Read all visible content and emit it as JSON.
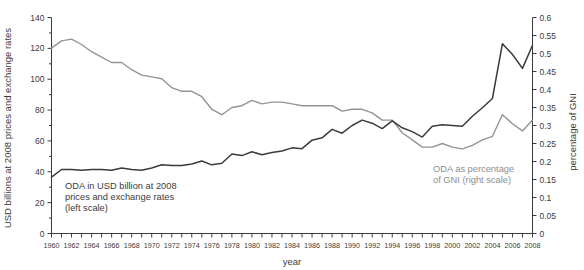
{
  "chart_data": {
    "type": "line",
    "title": "",
    "xlabel": "year",
    "ylabel": "USD billions at 2008 prices and exchange rates",
    "y2label": "percentage of GNI",
    "xlim": [
      1960,
      2008
    ],
    "ylim": [
      0,
      140
    ],
    "y2lim": [
      0,
      0.6
    ],
    "grid": false,
    "legend_position": "inline-annotations",
    "x": [
      1960,
      1961,
      1962,
      1963,
      1964,
      1965,
      1966,
      1967,
      1968,
      1969,
      1970,
      1971,
      1972,
      1973,
      1974,
      1975,
      1976,
      1977,
      1978,
      1979,
      1980,
      1981,
      1982,
      1983,
      1984,
      1985,
      1986,
      1987,
      1988,
      1989,
      1990,
      1991,
      1992,
      1993,
      1994,
      1995,
      1996,
      1997,
      1998,
      1999,
      2000,
      2001,
      2002,
      2003,
      2004,
      2005,
      2006,
      2007,
      2008
    ],
    "xtick_labels": [
      "1960",
      "1962",
      "1964",
      "1966",
      "1968",
      "1970",
      "1972",
      "1974",
      "1976",
      "1978",
      "1980",
      "1982",
      "1984",
      "1986",
      "1988",
      "1990",
      "1992",
      "1994",
      "1996",
      "1998",
      "2000",
      "2002",
      "2004",
      "2006",
      "2008"
    ],
    "ytick_labels": [
      "0",
      "20",
      "40",
      "60",
      "80",
      "100",
      "120",
      "140"
    ],
    "ytick_values": [
      0,
      20,
      40,
      60,
      80,
      100,
      120,
      140
    ],
    "y2tick_labels": [
      "0",
      "0.05",
      "0.1",
      "0.15",
      "0.2",
      "0.25",
      "0.3",
      "0.35",
      "0.4",
      "0.45",
      "0.5",
      "0.55",
      "0.6"
    ],
    "y2tick_values": [
      0,
      0.05,
      0.1,
      0.15,
      0.2,
      0.25,
      0.3,
      0.35,
      0.4,
      0.45,
      0.5,
      0.55,
      0.6
    ],
    "series": [
      {
        "name": "ODA in USD billion at 2008 prices and exchange rates",
        "axis": "left",
        "color": "#3b3b3b",
        "annotation": "ODA in USD billion at 2008\nprices and exchange rates\n(left scale)",
        "values": [
          36.5,
          41.5,
          41.5,
          41.0,
          41.5,
          41.5,
          41.0,
          42.5,
          41.5,
          41.0,
          42.5,
          44.5,
          44.0,
          44.0,
          45.0,
          47.0,
          44.5,
          45.5,
          51.5,
          50.5,
          53.0,
          51.0,
          52.5,
          53.5,
          55.5,
          55.0,
          60.5,
          62.0,
          67.5,
          65.0,
          70.0,
          73.5,
          71.5,
          68.0,
          73.0,
          68.5,
          66.0,
          62.5,
          69.5,
          70.5,
          70.0,
          69.5,
          76.0,
          81.5,
          87.5,
          123.0,
          116.0,
          107.0,
          122.0
        ]
      },
      {
        "name": "ODA as percentage of GNI",
        "axis": "right",
        "color": "#949494",
        "annotation": "ODA as percentage\nof GNI (right scale)",
        "values": [
          0.515,
          0.535,
          0.54,
          0.525,
          0.505,
          0.49,
          0.475,
          0.475,
          0.455,
          0.44,
          0.435,
          0.43,
          0.405,
          0.395,
          0.395,
          0.38,
          0.345,
          0.33,
          0.35,
          0.355,
          0.37,
          0.36,
          0.365,
          0.365,
          0.36,
          0.355,
          0.355,
          0.355,
          0.355,
          0.34,
          0.345,
          0.345,
          0.335,
          0.315,
          0.315,
          0.28,
          0.26,
          0.24,
          0.24,
          0.25,
          0.24,
          0.235,
          0.245,
          0.26,
          0.27,
          0.33,
          0.305,
          0.285,
          0.315
        ]
      }
    ]
  },
  "labels": {
    "y_axis_title": "USD billions at 2008 prices and exchange rates",
    "y2_axis_title": "percentage of GNI",
    "x_axis_title": "year",
    "annotation_left_line1": "ODA in USD billion at 2008",
    "annotation_left_line2": "prices and exchange rates",
    "annotation_left_line3": "(left scale)",
    "annotation_right_line1": "ODA as percentage",
    "annotation_right_line2": "of GNI (right scale)"
  },
  "colors": {
    "oda_series": "#3b3b3b",
    "gni_series": "#949494",
    "axis": "#3b3b3b",
    "background": "#ffffff"
  }
}
